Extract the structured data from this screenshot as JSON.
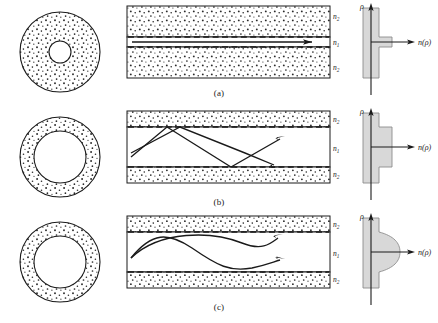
{
  "figure": {
    "rows": [
      {
        "caption": "(a)",
        "type": "single-mode step-index",
        "cross_section": {
          "outer_radius": 40,
          "core_radius": 11,
          "core_filled": false,
          "cladding_speckled": true
        },
        "side_view": {
          "core_label": "n",
          "core_sub": "1",
          "clad_label": "n",
          "clad_sub": "2",
          "core_half_height": 5,
          "ray_type": "straight",
          "ray_count": 1
        },
        "profile": {
          "y_axis_label": "ρ",
          "x_axis_label": "n(ρ)",
          "shape": "narrow-step",
          "step_width": 13,
          "step_half_height": 5,
          "bar_width": 16
        }
      },
      {
        "caption": "(b)",
        "type": "multimode step-index",
        "cross_section": {
          "outer_radius": 40,
          "core_radius": 26,
          "core_filled": false,
          "cladding_speckled": true
        },
        "side_view": {
          "core_label": "n",
          "core_sub": "1",
          "clad_label": "n",
          "clad_sub": "2",
          "core_half_height": 25,
          "ray_type": "zigzag",
          "ray_count": 2
        },
        "profile": {
          "y_axis_label": "ρ",
          "x_axis_label": "n(ρ)",
          "shape": "wide-step",
          "step_width": 13,
          "step_half_height": 25,
          "bar_width": 16
        }
      },
      {
        "caption": "(c)",
        "type": "multimode graded-index",
        "cross_section": {
          "outer_radius": 40,
          "core_radius": 26,
          "core_filled": false,
          "cladding_speckled": true
        },
        "side_view": {
          "core_label": "n",
          "core_sub": "1",
          "clad_label": "n",
          "clad_sub": "2",
          "core_half_height": 25,
          "ray_type": "sinusoidal",
          "ray_count": 2
        },
        "profile": {
          "y_axis_label": "ρ",
          "x_axis_label": "n(ρ)",
          "shape": "parabolic-bulge",
          "bulge_width": 22,
          "bulge_half_height": 25,
          "bar_width": 16
        }
      }
    ],
    "colors": {
      "stroke": "#1a1a1a",
      "speckle": "#2b2b2b",
      "fill_profile": "#d8d8d8",
      "background": "#ffffff",
      "core_fill": "#ffffff"
    }
  }
}
